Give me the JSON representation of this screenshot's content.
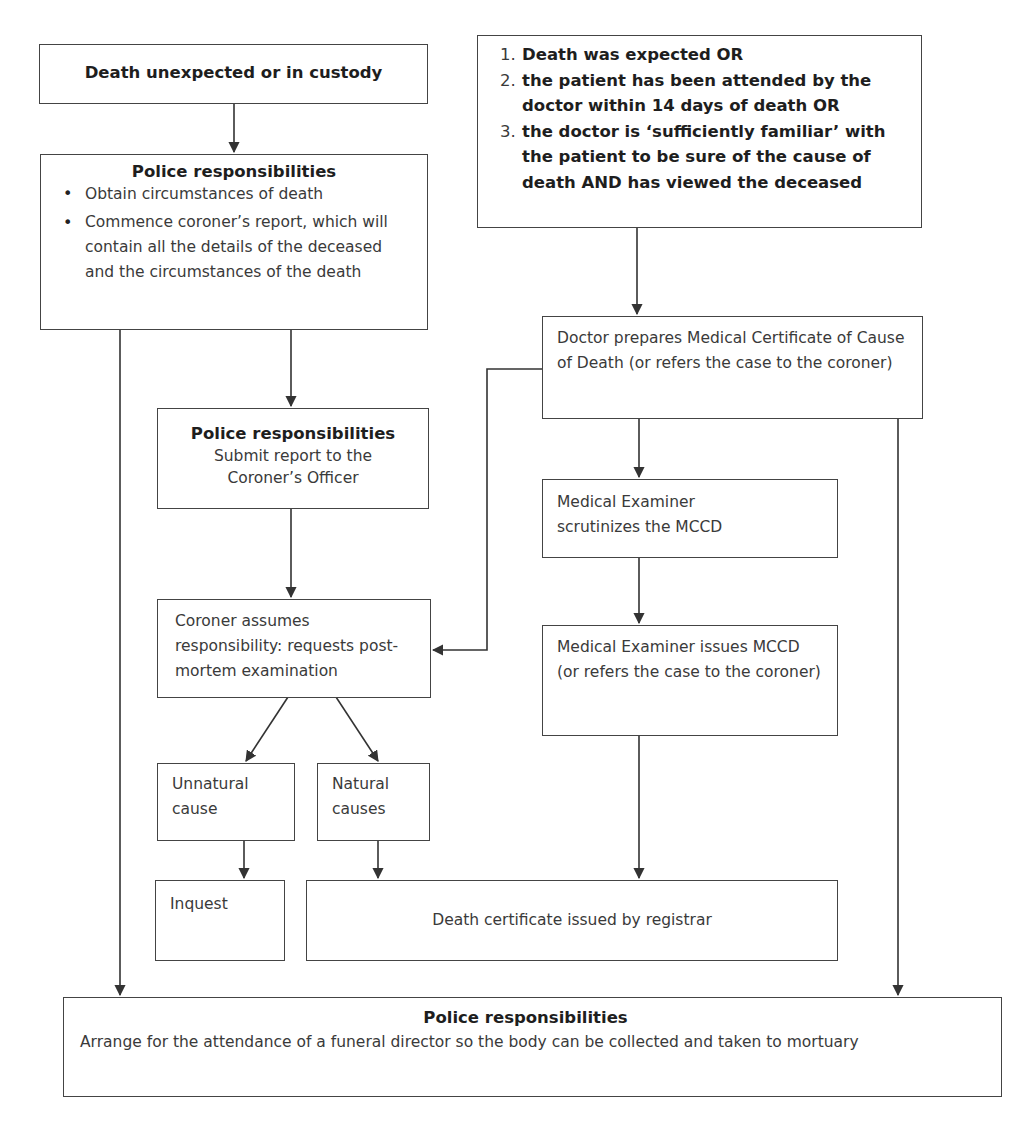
{
  "diagram": {
    "type": "flowchart",
    "nodes": {
      "start_unexpected": {
        "label": "Death unexpected or in custody"
      },
      "police_initial": {
        "title": "Police responsibilities",
        "bullets": [
          "Obtain circumstances of death",
          "Commence coroner’s report, which will contain all the details of the deceased and the circumstances of the death"
        ]
      },
      "expected_criteria": {
        "items": [
          {
            "num": "1.",
            "text": "Death was expected OR"
          },
          {
            "num": "2.",
            "text": "the patient has been attended by the doctor within 14 days of death OR"
          },
          {
            "num": "3.",
            "text": "the doctor is ‘sufficiently familiar’ with the patient to be sure of the cause  of death AND has viewed the deceased"
          }
        ]
      },
      "doctor_mccd": {
        "label": "Doctor prepares Medical Certificate of Cause of Death (or refers the case to the coroner)"
      },
      "police_submit": {
        "title": "Police responsibilities",
        "text": "Submit report to the Coroner’s Officer"
      },
      "me_scrutinizes": {
        "label": "Medical Examiner scrutinizes the MCCD"
      },
      "coroner_assumes": {
        "label": "Coroner assumes responsibility: requests post-mortem examination"
      },
      "me_issues": {
        "label": "Medical Examiner issues MCCD (or refers the case to the coroner)"
      },
      "unnatural_cause": {
        "label": "Unnatural cause"
      },
      "natural_causes": {
        "label": "Natural causes"
      },
      "inquest": {
        "label": "Inquest"
      },
      "death_certificate": {
        "label": "Death certificate issued by registrar"
      },
      "police_final": {
        "title": "Police responsibilities",
        "text": "Arrange for the attendance of a funeral director so the body can be collected and taken to mortuary"
      }
    },
    "edges": [
      {
        "from": "start_unexpected",
        "to": "police_initial"
      },
      {
        "from": "police_initial",
        "to": "police_submit"
      },
      {
        "from": "police_initial",
        "to": "police_final"
      },
      {
        "from": "expected_criteria",
        "to": "doctor_mccd"
      },
      {
        "from": "doctor_mccd",
        "to": "coroner_assumes"
      },
      {
        "from": "doctor_mccd",
        "to": "me_scrutinizes"
      },
      {
        "from": "doctor_mccd",
        "to": "police_final"
      },
      {
        "from": "police_submit",
        "to": "coroner_assumes"
      },
      {
        "from": "me_scrutinizes",
        "to": "me_issues"
      },
      {
        "from": "coroner_assumes",
        "to": "unnatural_cause"
      },
      {
        "from": "coroner_assumes",
        "to": "natural_causes"
      },
      {
        "from": "unnatural_cause",
        "to": "inquest"
      },
      {
        "from": "natural_causes",
        "to": "death_certificate"
      },
      {
        "from": "me_issues",
        "to": "death_certificate"
      }
    ],
    "colors": {
      "line": "#333333",
      "border": "#444444",
      "text": "#3a3a3a",
      "bold_text": "#1e1e1e",
      "background": "#ffffff"
    }
  }
}
